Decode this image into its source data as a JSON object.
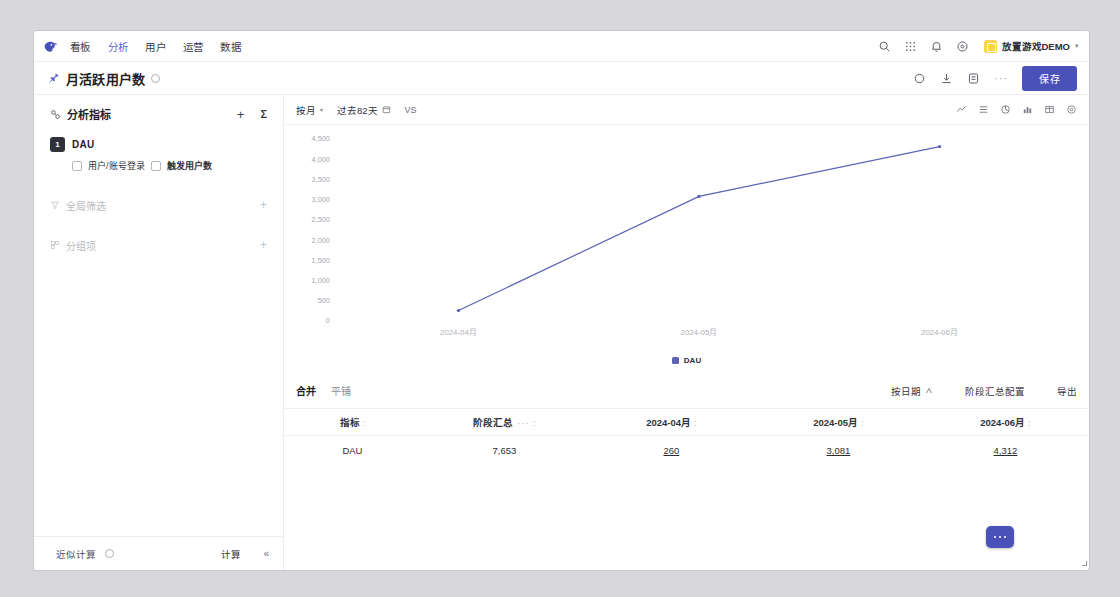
{
  "topnav": {
    "logo_name": "bird-logo",
    "items": [
      {
        "label": "看板",
        "active": false
      },
      {
        "label": "分析",
        "active": true
      },
      {
        "label": "用户",
        "active": false
      },
      {
        "label": "运营",
        "active": false
      },
      {
        "label": "数据",
        "active": false
      }
    ],
    "icons": [
      "search-icon",
      "grid-apps-icon",
      "bell-icon",
      "help-circle-icon"
    ],
    "project": "放置游戏DEMO",
    "project_caret": "▾"
  },
  "titlebar": {
    "title": "月活跃用户数",
    "save_label": "保存",
    "dots": "···",
    "icons": [
      "refresh-icon",
      "download-icon",
      "copy-icon"
    ]
  },
  "sidebar": {
    "header": "分析指标",
    "plus": "+",
    "sigma": "Σ",
    "metric": {
      "badge": "1",
      "name": "DAU",
      "event": "用户/账号登录",
      "measure": "触发用户数"
    },
    "sections": [
      {
        "label": "全局筛选",
        "plus": "+",
        "icon": "filter-icon"
      },
      {
        "label": "分组项",
        "plus": "+",
        "icon": "group-icon"
      }
    ],
    "footer": {
      "approx_label": "近似计算",
      "calc_label": "计算",
      "collapse": "«"
    }
  },
  "chart_toolbar": {
    "granularity": "按月",
    "caret": "▾",
    "date_range": "过去82天",
    "vs": "VS",
    "right_icons": [
      "line-chart-icon",
      "stacked-chart-icon",
      "pie-chart-icon",
      "bar-chart-icon",
      "table-icon",
      "settings-gear-icon"
    ]
  },
  "chart_data": {
    "type": "line",
    "title": "",
    "xlabel": "",
    "ylabel": "",
    "categories": [
      "2024-04月",
      "2024-05月",
      "2024-06月"
    ],
    "series": [
      {
        "name": "DAU",
        "color": "#5b63b5",
        "values": [
          260,
          3081,
          4312
        ]
      }
    ],
    "ylim": [
      0,
      4500
    ],
    "yticks": [
      4500,
      4000,
      3500,
      3000,
      2500,
      2000,
      1500,
      1000,
      500,
      0
    ],
    "ytick_labels": [
      "4,500",
      "4,000",
      "3,500",
      "3,000",
      "2,500",
      "2,000",
      "1,500",
      "1,000",
      "500",
      "0"
    ],
    "grid": false,
    "legend_position": "bottom",
    "legend": [
      "DAU"
    ]
  },
  "table_toolbar": {
    "merge": "合并",
    "tile": "平铺",
    "sort_by_date": "按日期",
    "stage_config": "阶段汇总配置",
    "export": "导出"
  },
  "table": {
    "columns": [
      "指标",
      "阶段汇总",
      "2024-04月",
      "2024-05月",
      "2024-06月"
    ],
    "col_colon": ":",
    "col_dots": "···",
    "rows": [
      {
        "metric": "DAU",
        "total": "7,653",
        "values": [
          "260",
          "3,081",
          "4,312"
        ]
      }
    ]
  },
  "fab": {
    "name": "chat-widget"
  },
  "colors": {
    "accent": "#4a51b8",
    "nav_active": "#5b63d3",
    "line": "#5b63b5",
    "badge": "#30303a",
    "project_tile": "#fcd34d"
  }
}
